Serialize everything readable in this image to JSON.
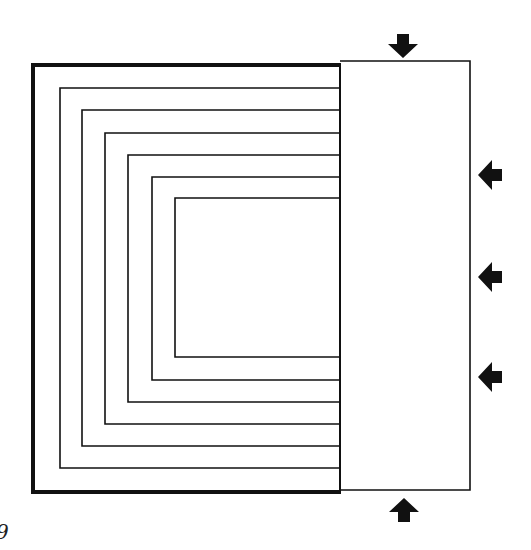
{
  "figure": {
    "caption_fragment": "9",
    "colors": {
      "ink": "#111111",
      "background": "#ffffff"
    },
    "outer_frame": {
      "left": 33,
      "top": 65,
      "right": 340,
      "bottom": 492,
      "stroke": 4
    },
    "right_box": {
      "left": 340,
      "top": 61,
      "right": 470,
      "bottom": 490,
      "stroke": 1.6
    },
    "nested_channels": [
      {
        "left": 60,
        "top": 88,
        "bottom": 468
      },
      {
        "left": 82,
        "top": 110,
        "bottom": 446
      },
      {
        "left": 105,
        "top": 133,
        "bottom": 424
      },
      {
        "left": 128,
        "top": 155,
        "bottom": 402
      },
      {
        "left": 152,
        "top": 177,
        "bottom": 380
      },
      {
        "left": 175,
        "top": 198,
        "bottom": 357
      }
    ],
    "arrows": [
      {
        "name": "top-arrow",
        "direction": "down",
        "x": 403,
        "y": 46
      },
      {
        "name": "right-arrow-1",
        "direction": "left",
        "x": 490,
        "y": 175
      },
      {
        "name": "right-arrow-2",
        "direction": "left",
        "x": 490,
        "y": 277
      },
      {
        "name": "right-arrow-3",
        "direction": "left",
        "x": 490,
        "y": 377
      },
      {
        "name": "bottom-arrow",
        "direction": "up",
        "x": 404,
        "y": 510
      }
    ]
  }
}
